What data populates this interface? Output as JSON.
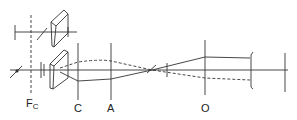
{
  "diagram": {
    "type": "optical-ray-diagram",
    "labels": {
      "fc_main": "F",
      "fc_sub": "C",
      "c": "C",
      "a": "A",
      "o": "O"
    },
    "colors": {
      "line": "#333333",
      "background": "#ffffff"
    }
  }
}
